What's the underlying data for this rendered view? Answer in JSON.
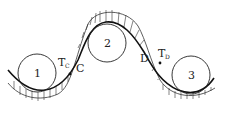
{
  "diagram": {
    "type": "belt-over-pulleys",
    "circles": [
      {
        "label": "1",
        "cx": 37,
        "cy": 73,
        "r": 19
      },
      {
        "label": "2",
        "cx": 107,
        "cy": 43,
        "r": 19
      },
      {
        "label": "3",
        "cx": 191,
        "cy": 75,
        "r": 19
      }
    ],
    "points": [
      {
        "label": "C",
        "x": 74,
        "y": 69
      },
      {
        "label": "D",
        "x": 145,
        "y": 58
      }
    ],
    "forces": [
      {
        "label": "T",
        "subscript": "C"
      },
      {
        "label": "T",
        "subscript": "D"
      }
    ],
    "colors": {
      "stroke": "#222222",
      "background": "#ffffff"
    }
  }
}
